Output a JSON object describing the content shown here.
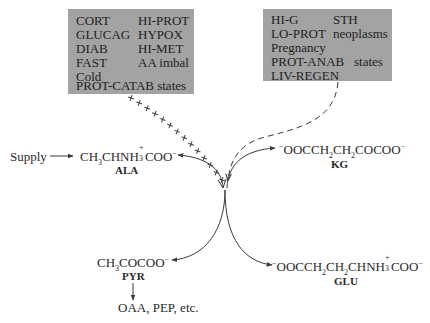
{
  "diagram": {
    "type": "metabolic-pathway",
    "title": "",
    "left_box": {
      "column1": [
        "CORT",
        "GLUCAG",
        "DIAB",
        "FAST",
        "Cold"
      ],
      "column2": [
        "HI-PROT",
        "HYPOX",
        "HI-MET",
        "AA imbal"
      ],
      "footer": "PROT-CATAB states",
      "effect": "stimulates",
      "connector_style": "crosses"
    },
    "right_box": {
      "column1": [
        "HI-G",
        "LO-PROT",
        "Pregnancy"
      ],
      "column2": [
        "STH",
        "neoplasms"
      ],
      "row_prot_anab": "PROT-ANAB",
      "row_prot_anab_suffix": "states",
      "last": "LIV-REGEN",
      "effect": "inhibits",
      "connector_style": "dashed"
    },
    "supply_label": "Supply",
    "compounds": {
      "ala": {
        "formula_parts": [
          "CH",
          "3",
          "CHNH",
          "+",
          "3",
          "COO",
          "−"
        ],
        "abbr": "ALA"
      },
      "kg": {
        "formula_parts": [
          "−",
          "OOCCH",
          "2",
          "CH",
          "2",
          "COCOO",
          "−"
        ],
        "abbr": "KG"
      },
      "pyr": {
        "formula_parts": [
          "CH",
          "3",
          "COCOO",
          "−"
        ],
        "abbr": "PYR"
      },
      "glu": {
        "formula_parts": [
          "−",
          "OOCCH",
          "2",
          "CH",
          "2",
          "CHNH",
          "+",
          "3",
          "COO",
          "−"
        ],
        "abbr": "GLU"
      }
    },
    "products_label": "OAA, PEP, etc.",
    "edges": [
      {
        "from": "Supply",
        "to": "ALA"
      },
      {
        "from": "ALA",
        "to": "PYR",
        "via": "transamination"
      },
      {
        "from": "KG",
        "to": "GLU",
        "via": "transamination"
      },
      {
        "from": "PYR",
        "to": "OAA, PEP, etc."
      },
      {
        "from": "left_box",
        "to": "transamination",
        "style": "crosses"
      },
      {
        "from": "right_box",
        "to": "transamination",
        "style": "dashed"
      }
    ],
    "colors": {
      "box_fill": "#a3a3a3",
      "ink": "#2a2a2a",
      "background": "#ffffff"
    }
  }
}
